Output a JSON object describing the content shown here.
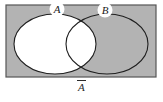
{
  "figure": {
    "type": "venn-diagram",
    "caption": "A",
    "caption_notation": "overbar",
    "caption_meaning": "complement of A",
    "universe": {
      "label": "universal-set-rectangle",
      "fill_color": "#b3b3b3",
      "stroke_color": "#555555",
      "x": 6,
      "y": 5,
      "width": 150,
      "height": 72
    },
    "sets": [
      {
        "id": "A",
        "label": "A",
        "shaded": false,
        "fill_color": "#ffffff",
        "stroke_color": "#1f1f1f",
        "cx": 55,
        "cy": 44,
        "rx": 41,
        "ry": 30,
        "badge": {
          "cx": 57,
          "cy": 9,
          "r": 7.5,
          "fill": "#ffffff"
        }
      },
      {
        "id": "B",
        "label": "B",
        "shaded": true,
        "fill_color": "none",
        "stroke_color": "#1f1f1f",
        "cx": 107,
        "cy": 44,
        "rx": 41,
        "ry": 30,
        "badge": {
          "cx": 105,
          "cy": 10,
          "r": 7.5,
          "fill": "#ffffff"
        }
      }
    ],
    "regions": [
      {
        "name": "A-only",
        "fill": "#ffffff",
        "description": "white, not shaded"
      },
      {
        "name": "A-intersect-B",
        "fill": "#ffffff",
        "description": "white, not shaded"
      },
      {
        "name": "B-only",
        "fill": "#b3b3b3",
        "description": "gray, shaded"
      },
      {
        "name": "outside-A-and-B",
        "fill": "#b3b3b3",
        "description": "gray, shaded"
      }
    ]
  }
}
